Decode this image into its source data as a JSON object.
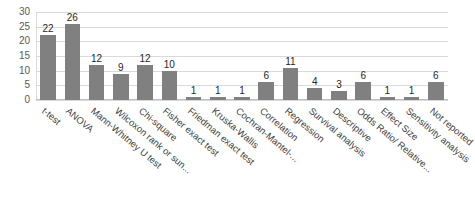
{
  "chart_data": {
    "type": "bar",
    "title": "",
    "subtitle": "",
    "xlabel": "",
    "ylabel": "",
    "ylim": [
      0,
      30
    ],
    "yticks": [
      0,
      5,
      10,
      15,
      20,
      25,
      30
    ],
    "grid": true,
    "legend": false,
    "bar_color": "#808080",
    "gridline_color": "#D9D9D9",
    "categories": [
      "t-test",
      "ANOVA",
      "Mann-Whitney U test",
      "Wilcoxon rank or sun...",
      "Chi-square",
      "Fisher exact test",
      "Friedman exact test",
      "Kruska-Wallis",
      "Cochran-Mantel-...",
      "Correlation",
      "Regression",
      "Survival analysis",
      "Descriptive",
      "Odds Ratio/ Relative...",
      "Effect Size",
      "Sensitivity analysis",
      "Not reported"
    ],
    "values": [
      22,
      26,
      12,
      9,
      12,
      10,
      1,
      1,
      1,
      6,
      11,
      4,
      3,
      6,
      1,
      1,
      6
    ]
  }
}
